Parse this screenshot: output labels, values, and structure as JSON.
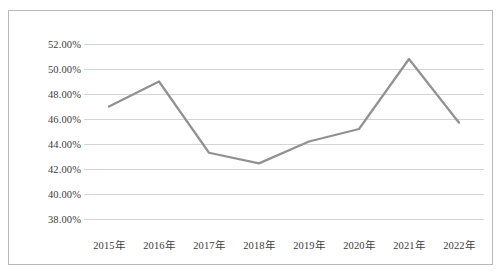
{
  "figure": {
    "border_color": "#b9b9b9",
    "background": "#ffffff"
  },
  "chart_data": {
    "type": "line",
    "title": "",
    "subtitle": "",
    "xlabel": "",
    "ylabel": "",
    "categories": [
      "2015年",
      "2016年",
      "2017年",
      "2018年",
      "2019年",
      "2020年",
      "2021年",
      "2022年"
    ],
    "values": [
      47.0,
      49.0,
      43.3,
      42.45,
      44.2,
      45.2,
      50.8,
      45.7
    ],
    "value_labels": [
      "47.00%",
      "49.00%",
      "43.30%",
      "42.45%",
      "44.20%",
      "45.20%",
      "50.80%",
      "45.70%"
    ],
    "ylim": [
      38.0,
      52.0
    ],
    "ytick_values": [
      52.0,
      50.0,
      48.0,
      46.0,
      44.0,
      42.0,
      40.0,
      38.0
    ],
    "ytick_labels": [
      "52.00%",
      "50.00%",
      "48.00%",
      "46.00%",
      "44.00%",
      "42.00%",
      "40.00%",
      "38.00%"
    ],
    "grid": true,
    "grid_color": "#d4d4d4",
    "legend": null,
    "legend_position": "none",
    "series_color": "#919191",
    "line_width": 2.2,
    "markers": false,
    "annotations": []
  }
}
